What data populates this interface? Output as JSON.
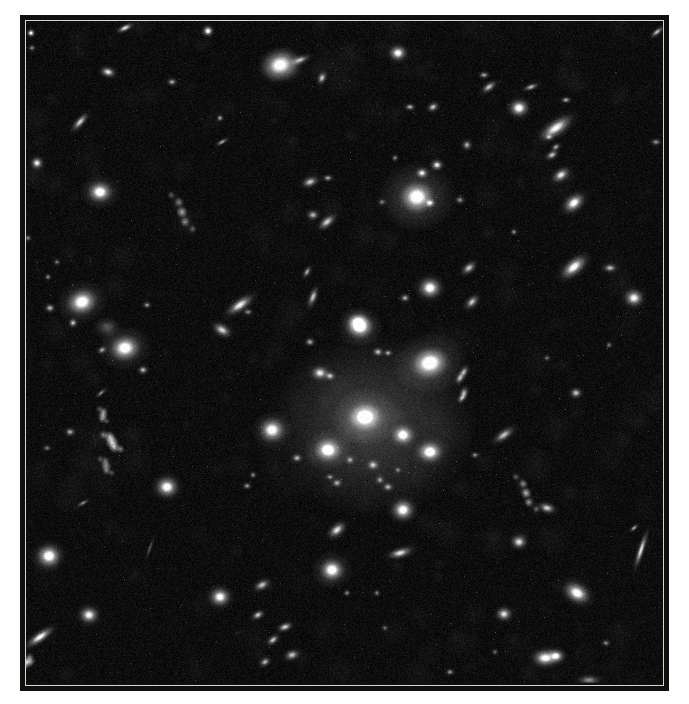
{
  "figure": {
    "colors": {
      "page_bg": "#ffffff",
      "frame": "#101010",
      "inner_line": "#d8d5cd",
      "sky_base": "#0d0d0d",
      "galaxy_light": "#ffffff"
    },
    "sky": {
      "width": 637,
      "height": 662,
      "origin": [
        26,
        21
      ],
      "noise_amplitude": 9,
      "mottle_blobs": 260,
      "seed": 1234
    },
    "diffuse_glow": {
      "x": 372,
      "y": 425,
      "rx": 105,
      "ry": 92,
      "alpha": 0.2
    },
    "galaxies": [
      {
        "x": 31,
        "y": 33,
        "rx": 2.2,
        "ry": 2.2,
        "a": 0,
        "b": 0.85
      },
      {
        "x": 125,
        "y": 28,
        "rx": 5,
        "ry": 2,
        "a": -25,
        "b": 0.7
      },
      {
        "x": 208,
        "y": 31,
        "rx": 3,
        "ry": 3,
        "a": 0,
        "b": 0.9
      },
      {
        "x": 108,
        "y": 72,
        "rx": 4.5,
        "ry": 3,
        "a": 15,
        "b": 0.7
      },
      {
        "x": 172,
        "y": 82,
        "rx": 3,
        "ry": 2.2,
        "a": 0,
        "b": 0.5
      },
      {
        "x": 32,
        "y": 48,
        "rx": 2,
        "ry": 2,
        "a": 0,
        "b": 0.4
      },
      {
        "x": 80,
        "y": 122,
        "rx": 6.5,
        "ry": 2.5,
        "a": -48,
        "b": 0.65
      },
      {
        "x": 37,
        "y": 163,
        "rx": 3.5,
        "ry": 3.5,
        "a": 0,
        "b": 0.75
      },
      {
        "x": 100,
        "y": 192,
        "rx": 7,
        "ry": 6,
        "a": 0,
        "b": 0.95,
        "h": 3
      },
      {
        "x": 182,
        "y": 212,
        "rx": 20,
        "ry": 3.2,
        "a": 62,
        "b": 0.55,
        "k": "clumpy"
      },
      {
        "x": 220,
        "y": 118,
        "rx": 2,
        "ry": 2,
        "a": 0,
        "b": 0.5
      },
      {
        "x": 222,
        "y": 142,
        "rx": 4,
        "ry": 1.5,
        "a": -30,
        "b": 0.5
      },
      {
        "x": 28,
        "y": 238,
        "rx": 2,
        "ry": 2,
        "a": 0,
        "b": 0.4
      },
      {
        "x": 57,
        "y": 262,
        "rx": 2,
        "ry": 2,
        "a": 0,
        "b": 0.35
      },
      {
        "x": 280,
        "y": 65,
        "rx": 11,
        "ry": 9,
        "a": -20,
        "b": 0.9,
        "h": 2.2
      },
      {
        "x": 300,
        "y": 60,
        "rx": 6,
        "ry": 2.5,
        "a": -20,
        "b": 0.55
      },
      {
        "x": 322,
        "y": 78,
        "rx": 4,
        "ry": 2.5,
        "a": -65,
        "b": 0.6
      },
      {
        "x": 398,
        "y": 53,
        "rx": 5,
        "ry": 4.5,
        "a": 0,
        "b": 0.85
      },
      {
        "x": 410,
        "y": 107,
        "rx": 3,
        "ry": 2,
        "a": 0,
        "b": 0.55
      },
      {
        "x": 433,
        "y": 107,
        "rx": 3.5,
        "ry": 2.5,
        "a": -30,
        "b": 0.6
      },
      {
        "x": 484,
        "y": 75,
        "rx": 3,
        "ry": 2,
        "a": 0,
        "b": 0.5
      },
      {
        "x": 489,
        "y": 87,
        "rx": 5,
        "ry": 2.5,
        "a": -35,
        "b": 0.6
      },
      {
        "x": 531,
        "y": 87,
        "rx": 4.5,
        "ry": 2,
        "a": -20,
        "b": 0.55
      },
      {
        "x": 566,
        "y": 100,
        "rx": 3,
        "ry": 2,
        "a": 0,
        "b": 0.5
      },
      {
        "x": 519,
        "y": 108,
        "rx": 5.5,
        "ry": 5,
        "a": 0,
        "b": 0.9
      },
      {
        "x": 556,
        "y": 128,
        "rx": 11,
        "ry": 4.5,
        "a": -35,
        "b": 0.8
      },
      {
        "x": 549,
        "y": 137,
        "rx": 2.5,
        "ry": 2,
        "a": 0,
        "b": 0.45
      },
      {
        "x": 556,
        "y": 147,
        "rx": 3,
        "ry": 2,
        "a": -30,
        "b": 0.5
      },
      {
        "x": 552,
        "y": 155,
        "rx": 4,
        "ry": 2.5,
        "a": -30,
        "b": 0.6
      },
      {
        "x": 561,
        "y": 175,
        "rx": 5.5,
        "ry": 3.5,
        "a": -35,
        "b": 0.7
      },
      {
        "x": 574,
        "y": 203,
        "rx": 7,
        "ry": 4.5,
        "a": -40,
        "b": 0.85
      },
      {
        "x": 657,
        "y": 32,
        "rx": 4.5,
        "ry": 1.8,
        "a": -40,
        "b": 0.6
      },
      {
        "x": 467,
        "y": 145,
        "rx": 3,
        "ry": 3,
        "a": 0,
        "b": 0.5
      },
      {
        "x": 656,
        "y": 142,
        "rx": 3,
        "ry": 2,
        "a": 0,
        "b": 0.45
      },
      {
        "x": 310,
        "y": 182,
        "rx": 5,
        "ry": 3,
        "a": -20,
        "b": 0.6
      },
      {
        "x": 328,
        "y": 178,
        "rx": 3,
        "ry": 2,
        "a": 0,
        "b": 0.5
      },
      {
        "x": 313,
        "y": 215,
        "rx": 3.5,
        "ry": 3,
        "a": 0,
        "b": 0.55
      },
      {
        "x": 327,
        "y": 222,
        "rx": 6,
        "ry": 3,
        "a": -40,
        "b": 0.65
      },
      {
        "x": 307,
        "y": 272,
        "rx": 4,
        "ry": 2,
        "a": -60,
        "b": 0.5
      },
      {
        "x": 313,
        "y": 297,
        "rx": 6,
        "ry": 2.5,
        "a": -70,
        "b": 0.6
      },
      {
        "x": 240,
        "y": 305,
        "rx": 9,
        "ry": 3.5,
        "a": -35,
        "b": 0.75
      },
      {
        "x": 248,
        "y": 312,
        "rx": 3,
        "ry": 2,
        "a": 0,
        "b": 0.4
      },
      {
        "x": 417,
        "y": 197,
        "rx": 10,
        "ry": 9,
        "a": 0,
        "b": 1,
        "h": 4
      },
      {
        "x": 422,
        "y": 173,
        "rx": 3.5,
        "ry": 3,
        "a": 0,
        "b": 0.7
      },
      {
        "x": 437,
        "y": 165,
        "rx": 3.5,
        "ry": 3,
        "a": 0,
        "b": 0.75
      },
      {
        "x": 430,
        "y": 203,
        "rx": 3,
        "ry": 2.5,
        "a": 0,
        "b": 0.65
      },
      {
        "x": 460,
        "y": 200,
        "rx": 3,
        "ry": 2.5,
        "a": 0,
        "b": 0.4
      },
      {
        "x": 382,
        "y": 202,
        "rx": 2.5,
        "ry": 2,
        "a": 0,
        "b": 0.35
      },
      {
        "x": 395,
        "y": 158,
        "rx": 2,
        "ry": 2,
        "a": 0,
        "b": 0.4
      },
      {
        "x": 430,
        "y": 288,
        "rx": 6.5,
        "ry": 6,
        "a": 0,
        "b": 0.9
      },
      {
        "x": 405,
        "y": 298,
        "rx": 3,
        "ry": 2.5,
        "a": 0,
        "b": 0.5
      },
      {
        "x": 358,
        "y": 322,
        "rx": 6,
        "ry": 5,
        "a": 0,
        "b": 0.85
      },
      {
        "x": 82,
        "y": 302,
        "rx": 9,
        "ry": 7.5,
        "a": -20,
        "b": 0.95,
        "h": 3
      },
      {
        "x": 125,
        "y": 348,
        "rx": 9,
        "ry": 7.5,
        "a": -10,
        "b": 0.95,
        "h": 3
      },
      {
        "x": 107,
        "y": 327,
        "rx": 8,
        "ry": 6,
        "a": 0,
        "b": 0.22,
        "h": 1.8
      },
      {
        "x": 73,
        "y": 323,
        "rx": 2.5,
        "ry": 2.5,
        "a": 0,
        "b": 0.6
      },
      {
        "x": 48,
        "y": 277,
        "rx": 2,
        "ry": 2,
        "a": 0,
        "b": 0.4
      },
      {
        "x": 147,
        "y": 305,
        "rx": 2.5,
        "ry": 2,
        "a": 0,
        "b": 0.45
      },
      {
        "x": 102,
        "y": 350,
        "rx": 3,
        "ry": 2,
        "a": -30,
        "b": 0.5
      },
      {
        "x": 143,
        "y": 370,
        "rx": 3,
        "ry": 2.5,
        "a": 0,
        "b": 0.55
      },
      {
        "x": 222,
        "y": 330,
        "rx": 6,
        "ry": 3.5,
        "a": 30,
        "b": 0.65
      },
      {
        "x": 50,
        "y": 308,
        "rx": 3,
        "ry": 2.5,
        "a": 0,
        "b": 0.55
      },
      {
        "x": 101,
        "y": 393,
        "rx": 4,
        "ry": 1.5,
        "a": -40,
        "b": 0.4
      },
      {
        "x": 103,
        "y": 415,
        "rx": 7,
        "ry": 2.8,
        "a": 70,
        "b": 0.5,
        "k": "clumpy"
      },
      {
        "x": 112,
        "y": 442,
        "rx": 11,
        "ry": 3.5,
        "a": 48,
        "b": 0.75,
        "k": "clumpy"
      },
      {
        "x": 106,
        "y": 466,
        "rx": 9,
        "ry": 2.8,
        "a": 60,
        "b": 0.45,
        "k": "clumpy"
      },
      {
        "x": 70,
        "y": 432,
        "rx": 3,
        "ry": 2.5,
        "a": 0,
        "b": 0.5
      },
      {
        "x": 47,
        "y": 448,
        "rx": 2.5,
        "ry": 2,
        "a": 0,
        "b": 0.35
      },
      {
        "x": 360,
        "y": 327,
        "rx": 8,
        "ry": 7,
        "a": 0,
        "b": 0.95,
        "h": 3
      },
      {
        "x": 310,
        "y": 342,
        "rx": 3,
        "ry": 2.5,
        "a": 0,
        "b": 0.5
      },
      {
        "x": 378,
        "y": 352,
        "rx": 3,
        "ry": 2.5,
        "a": 0,
        "b": 0.55
      },
      {
        "x": 388,
        "y": 353,
        "rx": 2.5,
        "ry": 2,
        "a": 0,
        "b": 0.5
      },
      {
        "x": 430,
        "y": 363,
        "rx": 11,
        "ry": 9,
        "a": -15,
        "b": 1,
        "h": 3.5
      },
      {
        "x": 320,
        "y": 373,
        "rx": 5,
        "ry": 4,
        "a": 0,
        "b": 0.7
      },
      {
        "x": 330,
        "y": 376,
        "rx": 3,
        "ry": 2.5,
        "a": 0,
        "b": 0.55
      },
      {
        "x": 460,
        "y": 378,
        "rx": 4,
        "ry": 2.5,
        "a": -60,
        "b": 0.55
      },
      {
        "x": 462,
        "y": 398,
        "rx": 3.5,
        "ry": 2,
        "a": -50,
        "b": 0.5
      },
      {
        "x": 365,
        "y": 417,
        "rx": 10,
        "ry": 8.5,
        "a": 0,
        "b": 1,
        "h": 3.5
      },
      {
        "x": 403,
        "y": 435,
        "rx": 6,
        "ry": 5.5,
        "a": 0,
        "b": 0.9
      },
      {
        "x": 430,
        "y": 452,
        "rx": 7,
        "ry": 6,
        "a": 0,
        "b": 0.95
      },
      {
        "x": 328,
        "y": 450,
        "rx": 8,
        "ry": 7,
        "a": 0,
        "b": 0.95,
        "h": 3
      },
      {
        "x": 272,
        "y": 430,
        "rx": 7.5,
        "ry": 7,
        "a": 0,
        "b": 0.9,
        "h": 2.8
      },
      {
        "x": 297,
        "y": 458,
        "rx": 3,
        "ry": 2.5,
        "a": 0,
        "b": 0.5
      },
      {
        "x": 373,
        "y": 465,
        "rx": 3.5,
        "ry": 3,
        "a": 0,
        "b": 0.55
      },
      {
        "x": 350,
        "y": 460,
        "rx": 2.5,
        "ry": 2.5,
        "a": 0,
        "b": 0.45
      },
      {
        "x": 380,
        "y": 480,
        "rx": 2.5,
        "ry": 2.5,
        "a": 0,
        "b": 0.45
      },
      {
        "x": 330,
        "y": 477,
        "rx": 2.5,
        "ry": 2,
        "a": 0,
        "b": 0.4
      },
      {
        "x": 398,
        "y": 470,
        "rx": 2,
        "ry": 2,
        "a": 0,
        "b": 0.35
      },
      {
        "x": 337,
        "y": 483,
        "rx": 3,
        "ry": 2.5,
        "a": 0,
        "b": 0.5
      },
      {
        "x": 388,
        "y": 487,
        "rx": 3,
        "ry": 2.5,
        "a": 0,
        "b": 0.5
      },
      {
        "x": 475,
        "y": 455,
        "rx": 2.5,
        "ry": 2,
        "a": 0,
        "b": 0.4
      },
      {
        "x": 253,
        "y": 475,
        "rx": 2,
        "ry": 2,
        "a": 0,
        "b": 0.4
      },
      {
        "x": 247,
        "y": 486,
        "rx": 2.5,
        "ry": 2,
        "a": 0,
        "b": 0.45
      },
      {
        "x": 403,
        "y": 510,
        "rx": 6.5,
        "ry": 6,
        "a": 0,
        "b": 0.9
      },
      {
        "x": 337,
        "y": 530,
        "rx": 6,
        "ry": 3.5,
        "a": -40,
        "b": 0.7
      },
      {
        "x": 400,
        "y": 553,
        "rx": 7,
        "ry": 3,
        "a": -15,
        "b": 0.7
      },
      {
        "x": 332,
        "y": 570,
        "rx": 7,
        "ry": 6.5,
        "a": 0,
        "b": 0.95,
        "h": 3
      },
      {
        "x": 262,
        "y": 585,
        "rx": 5,
        "ry": 3,
        "a": -30,
        "b": 0.6
      },
      {
        "x": 347,
        "y": 593,
        "rx": 2,
        "ry": 2,
        "a": 0,
        "b": 0.4
      },
      {
        "x": 377,
        "y": 593,
        "rx": 2,
        "ry": 2,
        "a": 0,
        "b": 0.35
      },
      {
        "x": 385,
        "y": 628,
        "rx": 2,
        "ry": 2,
        "a": 0,
        "b": 0.3
      },
      {
        "x": 450,
        "y": 672,
        "rx": 2.5,
        "ry": 2,
        "a": 0,
        "b": 0.45
      },
      {
        "x": 495,
        "y": 652,
        "rx": 2,
        "ry": 2,
        "a": 0,
        "b": 0.3
      },
      {
        "x": 469,
        "y": 268,
        "rx": 5,
        "ry": 3,
        "a": -40,
        "b": 0.6
      },
      {
        "x": 472,
        "y": 302,
        "rx": 5,
        "ry": 3,
        "a": -45,
        "b": 0.6
      },
      {
        "x": 574,
        "y": 267,
        "rx": 9,
        "ry": 4.5,
        "a": -40,
        "b": 0.85
      },
      {
        "x": 610,
        "y": 268,
        "rx": 4,
        "ry": 2.5,
        "a": 0,
        "b": 0.55
      },
      {
        "x": 634,
        "y": 298,
        "rx": 5.5,
        "ry": 5,
        "a": 0,
        "b": 0.8
      },
      {
        "x": 514,
        "y": 232,
        "rx": 2,
        "ry": 2,
        "a": 0,
        "b": 0.4
      },
      {
        "x": 547,
        "y": 358,
        "rx": 2,
        "ry": 2,
        "a": 0,
        "b": 0.3
      },
      {
        "x": 576,
        "y": 393,
        "rx": 3.5,
        "ry": 3,
        "a": 0,
        "b": 0.6
      },
      {
        "x": 504,
        "y": 435,
        "rx": 7,
        "ry": 3,
        "a": -35,
        "b": 0.6
      },
      {
        "x": 464,
        "y": 372,
        "rx": 4,
        "ry": 2.5,
        "a": -60,
        "b": 0.5
      },
      {
        "x": 464,
        "y": 393,
        "rx": 4,
        "ry": 2.5,
        "a": -70,
        "b": 0.5
      },
      {
        "x": 609,
        "y": 345,
        "rx": 2,
        "ry": 2,
        "a": 0,
        "b": 0.35
      },
      {
        "x": 167,
        "y": 487,
        "rx": 6.5,
        "ry": 6,
        "a": 0,
        "b": 0.9
      },
      {
        "x": 49,
        "y": 556,
        "rx": 7,
        "ry": 6.5,
        "a": 0,
        "b": 0.95
      },
      {
        "x": 89,
        "y": 615,
        "rx": 5.5,
        "ry": 5,
        "a": 0,
        "b": 0.8
      },
      {
        "x": 40,
        "y": 637,
        "rx": 9,
        "ry": 3,
        "a": -35,
        "b": 0.8
      },
      {
        "x": 27,
        "y": 662,
        "rx": 6,
        "ry": 3.5,
        "a": -50,
        "b": 0.5,
        "k": "clumpy"
      },
      {
        "x": 220,
        "y": 597,
        "rx": 6,
        "ry": 5.5,
        "a": 0,
        "b": 0.85
      },
      {
        "x": 83,
        "y": 503,
        "rx": 4,
        "ry": 1.5,
        "a": -30,
        "b": 0.4
      },
      {
        "x": 150,
        "y": 548,
        "rx": 7,
        "ry": 1.2,
        "a": -70,
        "b": 0.25
      },
      {
        "x": 258,
        "y": 615,
        "rx": 4,
        "ry": 2.5,
        "a": -30,
        "b": 0.6
      },
      {
        "x": 285,
        "y": 627,
        "rx": 4.5,
        "ry": 2.5,
        "a": -20,
        "b": 0.65
      },
      {
        "x": 273,
        "y": 640,
        "rx": 4,
        "ry": 2.5,
        "a": -40,
        "b": 0.6
      },
      {
        "x": 292,
        "y": 655,
        "rx": 4.5,
        "ry": 3,
        "a": -20,
        "b": 0.6
      },
      {
        "x": 265,
        "y": 662,
        "rx": 3.5,
        "ry": 2.5,
        "a": -30,
        "b": 0.55
      },
      {
        "x": 526,
        "y": 493,
        "rx": 19,
        "ry": 3,
        "a": 62,
        "b": 0.6,
        "k": "clumpy"
      },
      {
        "x": 547,
        "y": 508,
        "rx": 5,
        "ry": 3,
        "a": 15,
        "b": 0.65
      },
      {
        "x": 519,
        "y": 542,
        "rx": 4.5,
        "ry": 4,
        "a": 0,
        "b": 0.7
      },
      {
        "x": 641,
        "y": 550,
        "rx": 11,
        "ry": 2,
        "a": -72,
        "b": 0.7
      },
      {
        "x": 634,
        "y": 528,
        "rx": 3,
        "ry": 1.5,
        "a": -40,
        "b": 0.5
      },
      {
        "x": 577,
        "y": 593,
        "rx": 8,
        "ry": 5.5,
        "a": 30,
        "b": 0.9
      },
      {
        "x": 504,
        "y": 614,
        "rx": 4.5,
        "ry": 4,
        "a": 0,
        "b": 0.7
      },
      {
        "x": 545,
        "y": 658,
        "rx": 7,
        "ry": 5,
        "a": 0,
        "b": 0.85
      },
      {
        "x": 556,
        "y": 656,
        "rx": 5,
        "ry": 4,
        "a": 0,
        "b": 0.8
      },
      {
        "x": 589,
        "y": 680,
        "rx": 7,
        "ry": 3,
        "a": 0,
        "b": 0.4
      },
      {
        "x": 606,
        "y": 643,
        "rx": 2.5,
        "ry": 2,
        "a": 0,
        "b": 0.4
      }
    ]
  }
}
